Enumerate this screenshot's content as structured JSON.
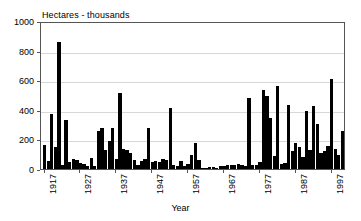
{
  "chart_data": {
    "type": "bar",
    "title": "Hectares - thousands",
    "xlabel": "Year",
    "ylabel": "Hectares - thousands",
    "ylim": [
      0,
      1000
    ],
    "xlim": [
      1916,
      2001
    ],
    "grid": true,
    "legend": null,
    "bar_color": "#000000",
    "ytick_labels": [
      "1000",
      "800",
      "600",
      "400",
      "200",
      "0"
    ],
    "ytick_values": [
      1000,
      800,
      600,
      400,
      200,
      0
    ],
    "xtick_labels": [
      "1917",
      "1927",
      "1937",
      "1947",
      "1957",
      "1967",
      "1977",
      "1987",
      "1997"
    ],
    "xtick_values": [
      1917,
      1927,
      1937,
      1947,
      1957,
      1967,
      1977,
      1987,
      1997
    ],
    "categories": [
      1917,
      1918,
      1919,
      1920,
      1921,
      1922,
      1923,
      1924,
      1925,
      1926,
      1927,
      1928,
      1929,
      1930,
      1931,
      1932,
      1933,
      1934,
      1935,
      1936,
      1937,
      1938,
      1939,
      1940,
      1941,
      1942,
      1943,
      1944,
      1945,
      1946,
      1947,
      1948,
      1949,
      1950,
      1951,
      1952,
      1953,
      1954,
      1955,
      1956,
      1957,
      1958,
      1959,
      1960,
      1961,
      1962,
      1963,
      1964,
      1965,
      1966,
      1967,
      1968,
      1969,
      1970,
      1971,
      1972,
      1973,
      1974,
      1975,
      1976,
      1977,
      1978,
      1979,
      1980,
      1981,
      1982,
      1983,
      1984,
      1985,
      1986,
      1987,
      1988,
      1989,
      1990,
      1991,
      1992,
      1993,
      1994,
      1995,
      1996,
      1997,
      1998,
      1999,
      2000
    ],
    "values": [
      160,
      55,
      375,
      150,
      860,
      30,
      330,
      50,
      70,
      60,
      40,
      35,
      20,
      75,
      20,
      260,
      275,
      130,
      190,
      280,
      65,
      515,
      135,
      130,
      105,
      60,
      30,
      55,
      70,
      275,
      45,
      55,
      45,
      70,
      60,
      410,
      25,
      20,
      55,
      20,
      35,
      95,
      175,
      60,
      10,
      10,
      15,
      12,
      10,
      20,
      20,
      30,
      30,
      25,
      35,
      25,
      20,
      480,
      25,
      30,
      45,
      535,
      490,
      345,
      85,
      560,
      35,
      40,
      435,
      120,
      175,
      150,
      80,
      390,
      130,
      425,
      305,
      105,
      125,
      155,
      610,
      135,
      95,
      255
    ]
  }
}
